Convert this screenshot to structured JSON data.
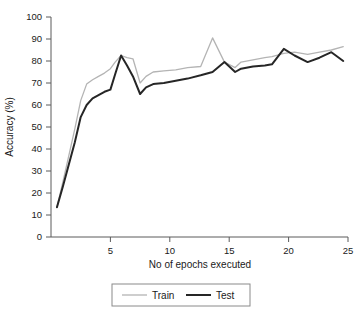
{
  "chart_data": {
    "type": "line",
    "title": "",
    "xlabel": "No of epochs executed",
    "ylabel": "Accuracy (%)",
    "xlim": [
      0,
      25
    ],
    "ylim": [
      0,
      100
    ],
    "xticks": [
      5,
      10,
      15,
      20,
      25
    ],
    "xtick_labels": [
      "5",
      "10",
      "15",
      "20",
      "25"
    ],
    "yticks": [
      0,
      10,
      20,
      30,
      40,
      50,
      60,
      70,
      80,
      90,
      100
    ],
    "ytick_labels": [
      "0",
      "10",
      "20",
      "30",
      "40",
      "50",
      "60",
      "70",
      "80",
      "90",
      "100"
    ],
    "grid": false,
    "legend_position": "below-plot",
    "series": [
      {
        "name": "Train",
        "color": "#b4b4b4",
        "line_width": 1.3,
        "x": [
          0.5,
          1.0,
          1.5,
          2.0,
          2.5,
          3.0,
          3.5,
          4.0,
          4.5,
          5.0,
          5.4,
          5.9,
          6.4,
          6.9,
          7.5,
          8.0,
          8.6,
          9.5,
          10.5,
          11.5,
          12.6,
          13.6,
          14.6,
          15.5,
          16.0,
          17.0,
          18.0,
          18.6,
          19.6,
          20.5,
          21.6,
          22.6,
          23.6,
          24.6
        ],
        "y": [
          13.5,
          25.0,
          37.0,
          49.0,
          62.0,
          69.5,
          71.5,
          73.0,
          74.5,
          76.5,
          79.5,
          82.5,
          81.5,
          81.0,
          70.0,
          73.0,
          75.0,
          75.5,
          76.0,
          77.0,
          77.5,
          90.5,
          79.5,
          77.0,
          79.5,
          80.5,
          81.5,
          82.0,
          83.5,
          84.0,
          83.0,
          84.0,
          85.0,
          86.5
        ]
      },
      {
        "name": "Test",
        "color": "#262626",
        "line_width": 2.0,
        "x": [
          0.5,
          1.0,
          1.5,
          2.0,
          2.5,
          3.0,
          3.5,
          4.0,
          4.5,
          5.0,
          5.4,
          5.9,
          6.4,
          6.9,
          7.5,
          8.0,
          8.6,
          9.5,
          10.5,
          11.5,
          12.6,
          13.6,
          14.6,
          15.5,
          16.0,
          17.0,
          18.0,
          18.6,
          19.6,
          20.5,
          21.6,
          22.6,
          23.6,
          24.6
        ],
        "y": [
          13.5,
          23.0,
          33.0,
          43.0,
          54.5,
          60.0,
          63.0,
          64.5,
          66.0,
          67.0,
          74.0,
          82.5,
          78.0,
          73.0,
          65.0,
          68.0,
          69.5,
          70.0,
          71.0,
          72.0,
          73.5,
          75.0,
          79.5,
          75.0,
          76.5,
          77.5,
          78.0,
          78.5,
          85.5,
          82.5,
          79.5,
          81.5,
          84.0,
          80.0
        ]
      }
    ]
  },
  "legend": {
    "items": [
      {
        "label": "Train",
        "color": "#b4b4b4"
      },
      {
        "label": "Test",
        "color": "#262626"
      }
    ]
  }
}
